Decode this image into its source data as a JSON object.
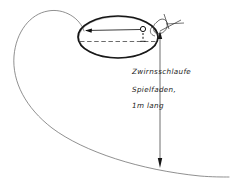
{
  "figure": {
    "background_color": "#ffffff",
    "ink_color": "#1a1a1a",
    "thread_color": "#555555"
  },
  "labels": {
    "loop_label": "Zwirnsschlaufe",
    "thread_label": "Spielfaden,",
    "length_label": "1m lang"
  },
  "annotations": {
    "balloon_name": "balloon-ellipse",
    "knot_name": "thread-knot",
    "valve_name": "balloon-valve",
    "loop_name": "thread-loop",
    "play_thread_name": "play-thread-curve",
    "dimension_name": "length-dimension-arrow",
    "centerline_name": "balloon-centerline",
    "width_line_name": "balloon-width-line"
  },
  "geometry": {
    "balloon_cx": 118,
    "balloon_cy": 37,
    "balloon_rx": 40,
    "balloon_ry": 21,
    "valve_cx": 143,
    "valve_cy": 29,
    "valve_r": 2.6,
    "dimension_x": 160,
    "dimension_y_top": 36,
    "dimension_y_bottom": 163,
    "text_x": 132,
    "text_line_y": [
      74,
      92,
      108
    ]
  }
}
